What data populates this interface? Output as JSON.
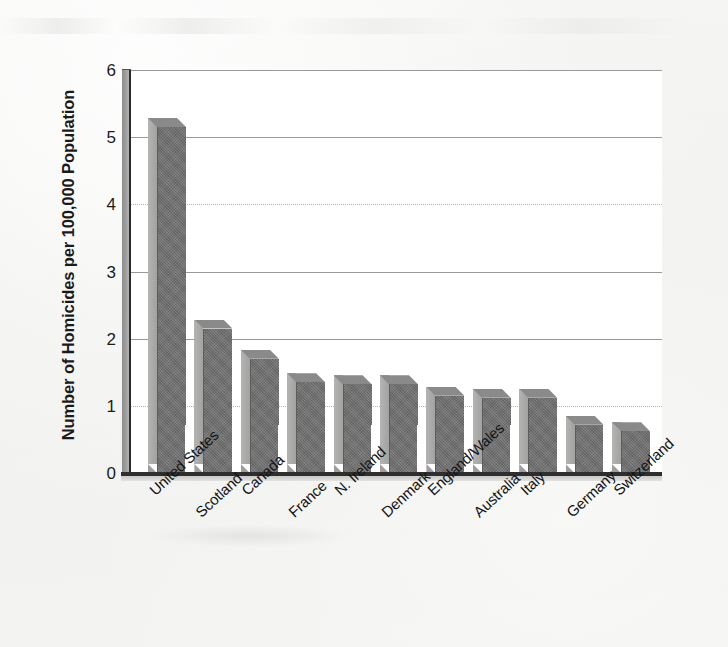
{
  "chart_data": {
    "type": "bar",
    "title": "",
    "xlabel": "",
    "ylabel": "Number of Homicides per 100,000 Population",
    "ylim": [
      0,
      6
    ],
    "yticks": [
      6,
      5,
      4,
      3,
      2,
      1,
      0
    ],
    "ytick_labels": [
      "6",
      "5",
      "4",
      "3",
      "2",
      "1",
      "0"
    ],
    "grid": true,
    "legend": null,
    "orientation": "vertical",
    "style": "3d-bar",
    "bar_color": "#6f6f6f",
    "bar_side_color": "#a2a2a0",
    "bar_top_color": "#8a8a8a",
    "background_color": "#f2f2f0",
    "plot_background_color": "#ffffff",
    "axis_color": "#2e2e2e",
    "gridline_color": "#9a9a9a",
    "categories": [
      "United States",
      "Scotland",
      "Canada",
      "France",
      "N. Ireland",
      "Denmark",
      "England/Wales",
      "Australia",
      "Italy",
      "Germany",
      "Switzerland"
    ],
    "values": [
      5.15,
      2.15,
      1.7,
      1.35,
      1.32,
      1.32,
      1.15,
      1.12,
      1.12,
      0.72,
      0.62
    ]
  },
  "axis": {
    "y_title": "Number of Homicides per 100,000 Population"
  }
}
